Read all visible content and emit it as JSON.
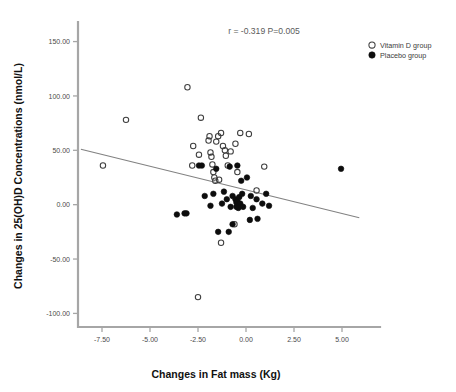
{
  "chart_data": {
    "type": "scatter",
    "title": "",
    "xlabel": "Changes in Fat mass (Kg)",
    "ylabel": "Changes in 25(OH)D Concentrations (nmol/L)",
    "xlim": [
      -8.75,
      6.25
    ],
    "ylim": [
      -112.5,
      168.0
    ],
    "grid": false,
    "xticks": [
      "-7.50",
      "-5.00",
      "-2.50",
      "0.00",
      "2.50",
      "5.00"
    ],
    "xtick_values": [
      -7.5,
      -5.0,
      -2.5,
      0.0,
      2.5,
      5.0
    ],
    "yticks": [
      "150.00",
      "100.00",
      "50.00",
      "0.00",
      "-50.00",
      "-100.00"
    ],
    "ytick_values": [
      150,
      100,
      50,
      0,
      -50,
      -100
    ],
    "annotation": "r = -0.319  P=0.005",
    "statistics": {
      "r": -0.319,
      "p": 0.005
    },
    "legend_position": "top-right",
    "legend": [
      {
        "label": "Vitamin D group",
        "marker": "open-circle"
      },
      {
        "label": "Placebo group",
        "marker": "filled-circle"
      }
    ],
    "fit_line": {
      "name": "linear-regression",
      "x_start": -8.6,
      "y_start": 51.0,
      "x_end": 5.9,
      "y_end": -12.0
    },
    "series": [
      {
        "name": "Vitamin D group",
        "marker": "open-circle",
        "points": [
          [
            -7.45,
            36.0
          ],
          [
            -6.25,
            78.0
          ],
          [
            -3.05,
            108.0
          ],
          [
            -2.75,
            54.0
          ],
          [
            -2.8,
            36.0
          ],
          [
            -2.45,
            46.0
          ],
          [
            -2.35,
            80.0
          ],
          [
            -1.95,
            59.0
          ],
          [
            -1.9,
            63.0
          ],
          [
            -1.85,
            48.0
          ],
          [
            -1.8,
            44.0
          ],
          [
            -1.75,
            37.0
          ],
          [
            -1.7,
            30.0
          ],
          [
            -1.65,
            25.0
          ],
          [
            -1.6,
            22.0
          ],
          [
            -1.55,
            58.0
          ],
          [
            -1.45,
            63.0
          ],
          [
            -1.4,
            23.0
          ],
          [
            -1.3,
            66.0
          ],
          [
            -1.2,
            54.0
          ],
          [
            -1.1,
            50.0
          ],
          [
            -1.05,
            45.0
          ],
          [
            -0.95,
            36.0
          ],
          [
            -0.8,
            49.0
          ],
          [
            -0.55,
            56.0
          ],
          [
            -0.45,
            30.0
          ],
          [
            -0.3,
            66.0
          ],
          [
            0.15,
            65.0
          ],
          [
            0.55,
            13.0
          ],
          [
            0.95,
            35.0
          ],
          [
            -0.6,
            -18.0
          ],
          [
            -1.3,
            -35.0
          ],
          [
            -2.5,
            -85.0
          ]
        ]
      },
      {
        "name": "Placebo group",
        "marker": "filled-circle",
        "points": [
          [
            -2.45,
            36.0
          ],
          [
            -2.3,
            36.0
          ],
          [
            -1.55,
            33.0
          ],
          [
            -0.85,
            35.0
          ],
          [
            -1.15,
            12.0
          ],
          [
            -0.45,
            36.0
          ],
          [
            -0.25,
            22.0
          ],
          [
            0.05,
            25.0
          ],
          [
            -1.7,
            10.0
          ],
          [
            -1.25,
            1.0
          ],
          [
            -1.0,
            5.0
          ],
          [
            -0.7,
            8.0
          ],
          [
            -0.55,
            5.0
          ],
          [
            -0.5,
            2.0
          ],
          [
            -0.45,
            3.0
          ],
          [
            -0.35,
            7.0
          ],
          [
            -0.3,
            1.0
          ],
          [
            -0.2,
            10.0
          ],
          [
            0.25,
            8.0
          ],
          [
            0.55,
            5.0
          ],
          [
            0.85,
            1.0
          ],
          [
            1.05,
            10.0
          ],
          [
            1.2,
            -1.0
          ],
          [
            -2.15,
            8.0
          ],
          [
            -1.85,
            -1.0
          ],
          [
            -3.6,
            -9.0
          ],
          [
            -3.2,
            -8.0
          ],
          [
            -3.1,
            -8.0
          ],
          [
            -0.8,
            -2.0
          ],
          [
            -0.5,
            -2.0
          ],
          [
            -0.4,
            -3.0
          ],
          [
            -0.15,
            -2.0
          ],
          [
            0.35,
            -3.0
          ],
          [
            0.6,
            -13.0
          ],
          [
            -0.7,
            -18.0
          ],
          [
            -1.45,
            -25.0
          ],
          [
            -0.9,
            -25.0
          ],
          [
            0.2,
            -14.0
          ],
          [
            4.95,
            33.0
          ]
        ]
      }
    ]
  }
}
